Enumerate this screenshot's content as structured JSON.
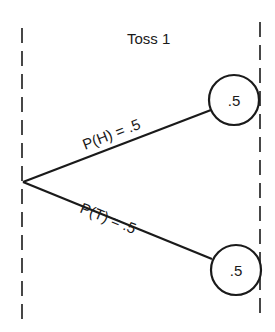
{
  "diagram": {
    "type": "probability-tree",
    "stage_label": "Toss 1",
    "branches": [
      {
        "label": "P(H) = .5",
        "outcome": "H",
        "node_value": ".5"
      },
      {
        "label": "P(T) = .5",
        "outcome": "T",
        "node_value": ".5"
      }
    ],
    "colors": {
      "ink": "#1a1a1a",
      "background": "#ffffff"
    }
  }
}
